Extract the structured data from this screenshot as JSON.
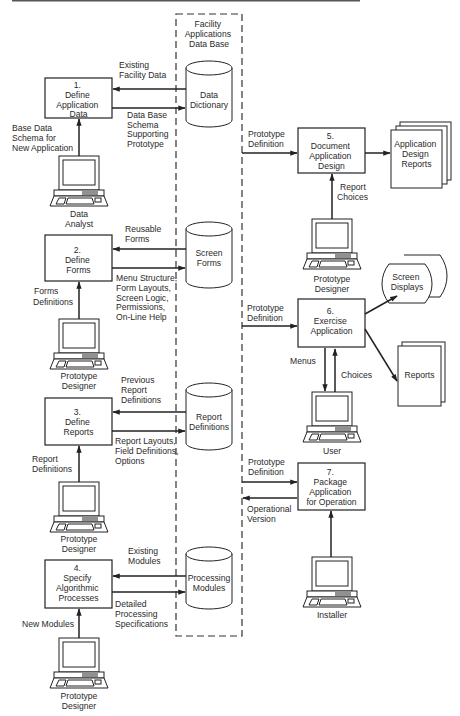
{
  "database": {
    "title": [
      "Facility",
      "Applications",
      "Data Base"
    ],
    "stores": [
      {
        "id": "data-dictionary",
        "label": [
          "Data",
          "Dictionary"
        ]
      },
      {
        "id": "screen-forms",
        "label": [
          "Screen",
          "Forms"
        ]
      },
      {
        "id": "report-definitions",
        "label": [
          "Report",
          "Definitions"
        ]
      },
      {
        "id": "processing-modules",
        "label": [
          "Processing",
          "Modules"
        ]
      }
    ]
  },
  "processes": [
    {
      "num": "1.",
      "label": [
        "Define",
        "Application",
        "Data"
      ]
    },
    {
      "num": "2.",
      "label": [
        "Define",
        "Forms"
      ]
    },
    {
      "num": "3.",
      "label": [
        "Define",
        "Reports"
      ]
    },
    {
      "num": "4.",
      "label": [
        "Specify",
        "Algorithmic",
        "Processes"
      ]
    },
    {
      "num": "5.",
      "label": [
        "Document",
        "Application",
        "Design"
      ]
    },
    {
      "num": "6.",
      "label": [
        "Exercise",
        "Application"
      ]
    },
    {
      "num": "7.",
      "label": [
        "Package",
        "Application",
        "for Operation"
      ]
    }
  ],
  "actors": [
    {
      "id": "data-analyst",
      "label": [
        "Data",
        "Analyst"
      ]
    },
    {
      "id": "prototype-designer-2",
      "label": [
        "Prototype",
        "Designer"
      ]
    },
    {
      "id": "prototype-designer-3",
      "label": [
        "Prototype",
        "Designer"
      ]
    },
    {
      "id": "prototype-designer-4",
      "label": [
        "Prototype",
        "Designer"
      ]
    },
    {
      "id": "prototype-designer-5",
      "label": [
        "Prototype",
        "Designer"
      ]
    },
    {
      "id": "user",
      "label": [
        "User"
      ]
    },
    {
      "id": "installer",
      "label": [
        "Installer"
      ]
    }
  ],
  "outputs": {
    "app_design_reports": [
      "Application",
      "Design",
      "Reports"
    ],
    "screen_displays": [
      "Screen",
      "Displays"
    ],
    "reports": [
      "Reports"
    ]
  },
  "flows": {
    "existing_facility_data": [
      "Existing",
      "Facility Data"
    ],
    "db_schema_supporting": [
      "Data Base",
      "Schema",
      "Supporting",
      "Prototype"
    ],
    "base_data_schema": [
      "Base Data",
      "Schema  for",
      "New Application"
    ],
    "reusable_forms": [
      "Reusable",
      "Forms"
    ],
    "menu_structure": [
      "Menu Structure,",
      "Form Layouts,",
      "Screen Logic,",
      "Permissions,",
      "On-Line Help"
    ],
    "forms_definitions": [
      "Forms",
      "Definitions"
    ],
    "previous_report_defs": [
      "Previous",
      "Report",
      "Definitions"
    ],
    "report_layouts": [
      "Report Layouts,",
      "Field Definitions,",
      "Options"
    ],
    "report_definitions": [
      "Report",
      "Definitions"
    ],
    "existing_modules": [
      "Existing",
      "Modules"
    ],
    "detailed_processing": [
      "Detailed",
      "Processing",
      "Specifications"
    ],
    "new_modules": [
      "New Modules"
    ],
    "prototype_definition_5": [
      "Prototype",
      "Definition"
    ],
    "report_choices": [
      "Report",
      "Choices"
    ],
    "prototype_definition_6": [
      "Prototype",
      "Definition"
    ],
    "menus": [
      "Menus"
    ],
    "choices": [
      "Choices"
    ],
    "prototype_definition_7": [
      "Prototype",
      "Definition"
    ],
    "operational_version": [
      "Operational",
      "Version"
    ]
  }
}
